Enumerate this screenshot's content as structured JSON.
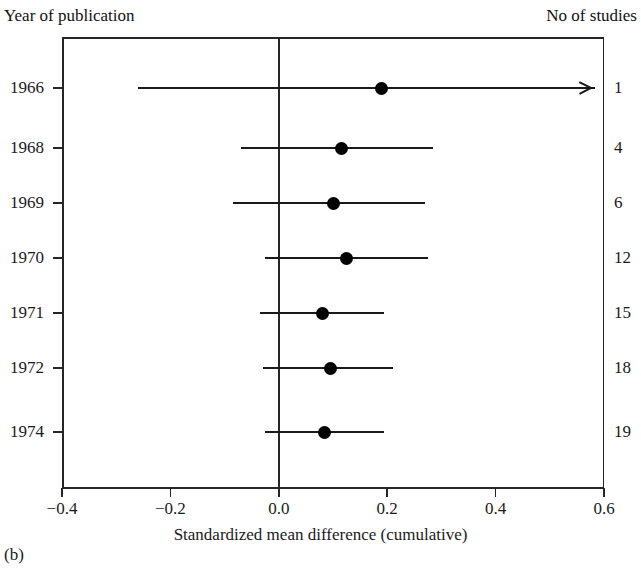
{
  "figure": {
    "panel_label": "(b)",
    "left_column_header": "Year of publication",
    "right_column_header": "No of studies",
    "x_axis_title": "Standardized mean difference (cumulative)",
    "line_color": "#1a1a1a",
    "marker_color": "#000000",
    "axis_color": "#262626",
    "background_color": "#ffffff"
  },
  "chart_data": {
    "type": "forest",
    "title": "",
    "subtitle": "",
    "xlabel": "Standardized mean difference (cumulative)",
    "ylabel": "Year of publication",
    "xlim": [
      -0.4,
      0.6
    ],
    "xticks": [
      -0.4,
      -0.2,
      0.0,
      0.2,
      0.4,
      0.6
    ],
    "xticklabels": [
      "−0.4",
      "−0.2",
      "0.0",
      "0.2",
      "0.4",
      "0.6"
    ],
    "grid": false,
    "legend": "none",
    "null_line": 0.0,
    "categories": [
      "1966",
      "1968",
      "1969",
      "1970",
      "1971",
      "1972",
      "1974"
    ],
    "right_axis_label": "No of studies",
    "right_axis_values": [
      1,
      4,
      6,
      12,
      15,
      18,
      19
    ],
    "rows": [
      {
        "year": "1966",
        "estimate": 0.19,
        "ci_low": -0.26,
        "ci_high": 0.6,
        "ci_high_truncated": true,
        "n_studies": "1"
      },
      {
        "year": "1968",
        "estimate": 0.115,
        "ci_low": -0.07,
        "ci_high": 0.285,
        "ci_high_truncated": false,
        "n_studies": "4"
      },
      {
        "year": "1969",
        "estimate": 0.1,
        "ci_low": -0.085,
        "ci_high": 0.27,
        "ci_high_truncated": false,
        "n_studies": "6"
      },
      {
        "year": "1970",
        "estimate": 0.125,
        "ci_low": -0.025,
        "ci_high": 0.275,
        "ci_high_truncated": false,
        "n_studies": "12"
      },
      {
        "year": "1971",
        "estimate": 0.08,
        "ci_low": -0.035,
        "ci_high": 0.195,
        "ci_high_truncated": false,
        "n_studies": "15"
      },
      {
        "year": "1972",
        "estimate": 0.095,
        "ci_low": -0.03,
        "ci_high": 0.21,
        "ci_high_truncated": false,
        "n_studies": "18"
      },
      {
        "year": "1974",
        "estimate": 0.085,
        "ci_low": -0.025,
        "ci_high": 0.195,
        "ci_high_truncated": false,
        "n_studies": "19"
      }
    ]
  }
}
